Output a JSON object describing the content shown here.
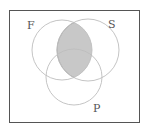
{
  "diagram": {
    "type": "venn",
    "sets": [
      {
        "id": "F",
        "label": "F"
      },
      {
        "id": "S",
        "label": "S"
      },
      {
        "id": "P",
        "label": "P"
      }
    ],
    "shaded_region": "F ∩ S",
    "colors": {
      "border": "#555555",
      "circle_stroke": "#bdbdbd",
      "shade_fill": "#c8c8c8",
      "shade_stroke": "#9e9e9e",
      "label": "#555555"
    }
  }
}
